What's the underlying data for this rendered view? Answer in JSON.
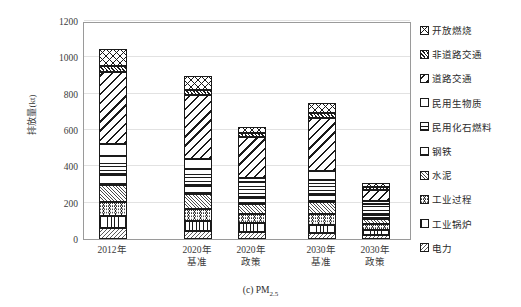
{
  "chart_data": {
    "type": "bar",
    "subtype": "stacked-bar",
    "title": "",
    "caption": "(c) PM",
    "caption_sub": "2.5",
    "xlabel": "",
    "ylabel": "排放量(kt)",
    "ylim": [
      0,
      1200
    ],
    "yticks": [
      0,
      200,
      400,
      600,
      800,
      1000,
      1200
    ],
    "ytick_labels": [
      "0",
      "200",
      "400",
      "600",
      "800",
      "1000",
      "1200"
    ],
    "grid": true,
    "legend_position": "right",
    "categories": [
      "2012年",
      "2020年基准",
      "2020年政策",
      "2030年基准",
      "2030年政策"
    ],
    "category_lines": [
      [
        "2012年",
        ""
      ],
      [
        "2020年",
        "基准"
      ],
      [
        "2020年",
        "政策"
      ],
      [
        "2030年",
        "基准"
      ],
      [
        "2030年",
        "政策"
      ]
    ],
    "series": [
      {
        "name": "电力",
        "pattern": "p-power",
        "values": [
          60,
          42,
          38,
          32,
          22
        ]
      },
      {
        "name": "工业锅炉",
        "pattern": "p-boiler",
        "values": [
          65,
          58,
          48,
          45,
          30
        ]
      },
      {
        "name": "工业过程",
        "pattern": "p-process",
        "values": [
          80,
          68,
          54,
          58,
          32
        ]
      },
      {
        "name": "水泥",
        "pattern": "p-cement",
        "values": [
          95,
          82,
          52,
          70,
          28
        ]
      },
      {
        "name": "钢铁",
        "pattern": "p-steel",
        "values": [
          50,
          42,
          34,
          36,
          22
        ]
      },
      {
        "name": "民用化石燃料",
        "pattern": "p-fossil",
        "values": [
          105,
          92,
          86,
          82,
          60
        ]
      },
      {
        "name": "民用生物质",
        "pattern": "p-bio",
        "values": [
          70,
          54,
          26,
          50,
          18
        ]
      },
      {
        "name": "道路交通",
        "pattern": "p-road",
        "values": [
          395,
          356,
          224,
          296,
          60
        ]
      },
      {
        "name": "非道路交通",
        "pattern": "p-nonroad",
        "values": [
          32,
          28,
          20,
          24,
          12
        ]
      },
      {
        "name": "开放燃烧",
        "pattern": "p-open",
        "values": [
          93,
          73,
          37,
          56,
          24
        ]
      }
    ],
    "totals": [
      1045,
      895,
      619,
      749,
      308
    ]
  },
  "legend": {
    "items": [
      {
        "label": "开放燃烧",
        "pattern": "p-open"
      },
      {
        "label": "非道路交通",
        "pattern": "p-nonroad"
      },
      {
        "label": "道路交通",
        "pattern": "p-road"
      },
      {
        "label": "民用生物质",
        "pattern": "p-bio"
      },
      {
        "label": "民用化石燃料",
        "pattern": "p-fossil"
      },
      {
        "label": "钢铁",
        "pattern": "p-steel"
      },
      {
        "label": "水泥",
        "pattern": "p-cement"
      },
      {
        "label": "工业过程",
        "pattern": "p-process"
      },
      {
        "label": "工业锅炉",
        "pattern": "p-boiler"
      },
      {
        "label": "电力",
        "pattern": "p-power"
      }
    ]
  },
  "colors": {
    "axis": "#9a9a9a",
    "grid": "#e2e2e2",
    "ink": "#1a1a1a",
    "text": "#2b2b2b",
    "background": "#ffffff"
  }
}
